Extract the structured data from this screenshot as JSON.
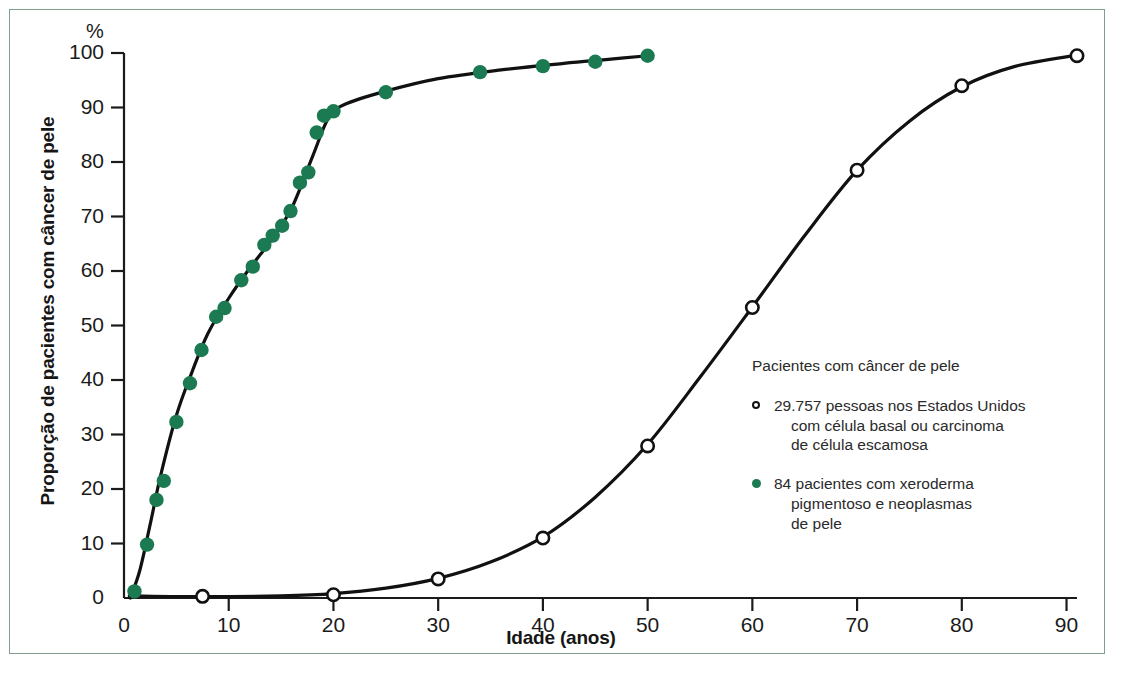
{
  "axes": {
    "y_unit_label": "%",
    "y_title": "Proporção de pacientes com câncer de pele",
    "x_title": "Idade (anos)",
    "y_ticks": [
      "100",
      "90",
      "80",
      "70",
      "60",
      "50",
      "40",
      "30",
      "20",
      "10",
      "0"
    ],
    "x_ticks": [
      "0",
      "10",
      "20",
      "30",
      "40",
      "50",
      "60",
      "70",
      "80",
      "90"
    ]
  },
  "legend": {
    "title": "Pacientes com câncer de pele",
    "entries": [
      {
        "marker": "open-circle-marker",
        "line1": "29.757 pessoas nos Estados Unidos",
        "line2": "com célula basal ou carcinoma",
        "line3": "de célula escamosa"
      },
      {
        "marker": "filled-circle-marker",
        "line1": "84 pacientes com xeroderma",
        "line2": "pigmentoso e neoplasmas",
        "line3": "de pele"
      }
    ]
  },
  "colors": {
    "xp_green": "#1c7a52",
    "curve_black": "#111111",
    "frame_green": "#7fa08c",
    "text": "#1b1b1b"
  },
  "chart_data": {
    "type": "scatter",
    "title": "",
    "xlabel": "Idade (anos)",
    "ylabel": "Proporção de pacientes com câncer de pele",
    "xlim": [
      0,
      91
    ],
    "ylim": [
      0,
      100
    ],
    "xticks": [
      0,
      10,
      20,
      30,
      40,
      50,
      60,
      70,
      80,
      90
    ],
    "yticks": [
      0,
      10,
      20,
      30,
      40,
      50,
      60,
      70,
      80,
      90,
      100
    ],
    "grid": false,
    "legend_position": "inside-right",
    "series": [
      {
        "name": "84 pacientes com xeroderma pigmentoso e neoplasmas de pele",
        "marker": "filled-circle",
        "color": "#1c7a52",
        "points": [
          {
            "x": 1.0,
            "y": 1.2
          },
          {
            "x": 2.2,
            "y": 9.8
          },
          {
            "x": 3.1,
            "y": 18.0
          },
          {
            "x": 3.8,
            "y": 21.5
          },
          {
            "x": 5.0,
            "y": 32.3
          },
          {
            "x": 6.3,
            "y": 39.4
          },
          {
            "x": 7.4,
            "y": 45.5
          },
          {
            "x": 8.8,
            "y": 51.6
          },
          {
            "x": 9.6,
            "y": 53.2
          },
          {
            "x": 11.2,
            "y": 58.3
          },
          {
            "x": 12.3,
            "y": 60.8
          },
          {
            "x": 13.4,
            "y": 64.8
          },
          {
            "x": 14.2,
            "y": 66.5
          },
          {
            "x": 15.1,
            "y": 68.3
          },
          {
            "x": 15.9,
            "y": 71.0
          },
          {
            "x": 16.8,
            "y": 76.2
          },
          {
            "x": 17.6,
            "y": 78.1
          },
          {
            "x": 18.4,
            "y": 85.4
          },
          {
            "x": 19.1,
            "y": 88.5
          },
          {
            "x": 20.0,
            "y": 89.3
          },
          {
            "x": 25.0,
            "y": 92.8
          },
          {
            "x": 34.0,
            "y": 96.5
          },
          {
            "x": 40.0,
            "y": 97.6
          },
          {
            "x": 45.0,
            "y": 98.4
          },
          {
            "x": 50.0,
            "y": 99.5
          }
        ],
        "fit_curve": [
          {
            "x": 0.6,
            "y": 0.0
          },
          {
            "x": 1.5,
            "y": 5.0
          },
          {
            "x": 2.5,
            "y": 13.5
          },
          {
            "x": 3.5,
            "y": 22.5
          },
          {
            "x": 5.0,
            "y": 33.5
          },
          {
            "x": 6.5,
            "y": 41.5
          },
          {
            "x": 8.0,
            "y": 48.5
          },
          {
            "x": 10.0,
            "y": 55.0
          },
          {
            "x": 12.0,
            "y": 60.5
          },
          {
            "x": 14.0,
            "y": 65.5
          },
          {
            "x": 16.0,
            "y": 71.5
          },
          {
            "x": 18.0,
            "y": 81.0
          },
          {
            "x": 19.5,
            "y": 88.0
          },
          {
            "x": 21.0,
            "y": 90.5
          },
          {
            "x": 25.0,
            "y": 93.0
          },
          {
            "x": 30.0,
            "y": 95.3
          },
          {
            "x": 36.0,
            "y": 96.9
          },
          {
            "x": 42.0,
            "y": 98.1
          },
          {
            "x": 46.0,
            "y": 98.8
          },
          {
            "x": 50.0,
            "y": 99.5
          }
        ]
      },
      {
        "name": "29.757 pessoas nos Estados Unidos com célula basal ou carcinoma de célula escamosa",
        "marker": "open-circle",
        "color": "#111111",
        "points": [
          {
            "x": 7.5,
            "y": 0.3
          },
          {
            "x": 20.0,
            "y": 0.6
          },
          {
            "x": 30.0,
            "y": 3.5
          },
          {
            "x": 40.0,
            "y": 11.0
          },
          {
            "x": 50.0,
            "y": 27.9
          },
          {
            "x": 60.0,
            "y": 53.3
          },
          {
            "x": 70.0,
            "y": 78.5
          },
          {
            "x": 80.0,
            "y": 94.0
          },
          {
            "x": 91.0,
            "y": 99.5
          }
        ],
        "fit_curve": [
          {
            "x": 0.5,
            "y": 0.4
          },
          {
            "x": 7.5,
            "y": 0.25
          },
          {
            "x": 15.0,
            "y": 0.4
          },
          {
            "x": 20.0,
            "y": 0.8
          },
          {
            "x": 25.0,
            "y": 1.8
          },
          {
            "x": 30.0,
            "y": 3.6
          },
          {
            "x": 35.0,
            "y": 6.6
          },
          {
            "x": 40.0,
            "y": 11.2
          },
          {
            "x": 45.0,
            "y": 18.5
          },
          {
            "x": 50.0,
            "y": 28.2
          },
          {
            "x": 55.0,
            "y": 40.5
          },
          {
            "x": 60.0,
            "y": 53.4
          },
          {
            "x": 65.0,
            "y": 66.5
          },
          {
            "x": 70.0,
            "y": 78.5
          },
          {
            "x": 75.0,
            "y": 87.5
          },
          {
            "x": 80.0,
            "y": 93.8
          },
          {
            "x": 85.0,
            "y": 97.5
          },
          {
            "x": 91.0,
            "y": 99.6
          }
        ]
      }
    ]
  }
}
